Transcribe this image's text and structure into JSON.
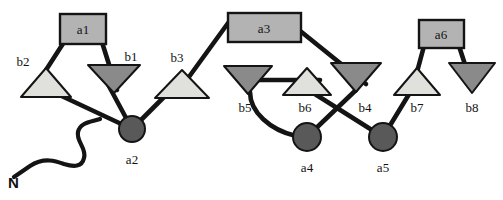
{
  "figure": {
    "type": "diagram",
    "background_color": "#ffffff",
    "stroke_color": "#141414"
  },
  "palette": {
    "box_fill": "#b3b3b3",
    "box_stroke": "#141414",
    "circle_fill": "#595959",
    "circle_stroke": "#141414",
    "triangle_light_fill": "#e0e0dc",
    "triangle_dark_fill": "#8a8a8a",
    "triangle_stroke": "#141414",
    "line_color": "#141414",
    "text_color": "#111111"
  },
  "nodes": {
    "boxes": [
      {
        "id": "a1",
        "label": "a1",
        "x": 60,
        "y": 14,
        "w": 46,
        "h": 30,
        "label_x": 83,
        "label_y": 34
      },
      {
        "id": "a3",
        "label": "a3",
        "x": 228,
        "y": 13,
        "w": 73,
        "h": 29,
        "label_x": 264,
        "label_y": 33
      },
      {
        "id": "a6",
        "label": "a6",
        "x": 419,
        "y": 20,
        "w": 45,
        "h": 28,
        "label_x": 441,
        "label_y": 39
      }
    ],
    "circles": [
      {
        "id": "a2",
        "label": "a2",
        "cx": 132,
        "cy": 129,
        "r": 13,
        "label_x": 132,
        "label_y": 164
      },
      {
        "id": "a4",
        "label": "a4",
        "cx": 307,
        "cy": 137,
        "r": 14,
        "label_x": 307,
        "label_y": 172
      },
      {
        "id": "a5",
        "label": "a5",
        "cx": 383,
        "cy": 137,
        "r": 14,
        "label_x": 383,
        "label_y": 172
      }
    ],
    "triangles": [
      {
        "id": "b2",
        "label": "b2",
        "dir": "up",
        "shade": "light",
        "cx": 46,
        "top_y": 68,
        "base_y": 97,
        "half_w": 25,
        "label_x": 23,
        "label_y": 66
      },
      {
        "id": "b1",
        "label": "b1",
        "dir": "down",
        "shade": "dark",
        "cx": 114,
        "top_y": 65,
        "base_y": 93,
        "half_w": 26,
        "label_x": 131,
        "label_y": 61
      },
      {
        "id": "b3",
        "label": "b3",
        "dir": "up",
        "shade": "light",
        "cx": 182,
        "top_y": 70,
        "base_y": 98,
        "half_w": 27,
        "label_x": 177,
        "label_y": 62
      },
      {
        "id": "b5",
        "label": "b5",
        "dir": "down",
        "shade": "dark",
        "cx": 248,
        "top_y": 66,
        "base_y": 94,
        "half_w": 24,
        "label_x": 245,
        "label_y": 112
      },
      {
        "id": "b6",
        "label": "b6",
        "dir": "up",
        "shade": "light",
        "cx": 307,
        "top_y": 68,
        "base_y": 95,
        "half_w": 24,
        "label_x": 305,
        "label_y": 112
      },
      {
        "id": "b4",
        "label": "b4",
        "dir": "down",
        "shade": "dark",
        "cx": 356,
        "top_y": 63,
        "base_y": 92,
        "half_w": 25,
        "label_x": 365,
        "label_y": 112
      },
      {
        "id": "b7",
        "label": "b7",
        "dir": "up",
        "shade": "light",
        "cx": 417,
        "top_y": 68,
        "base_y": 95,
        "half_w": 23,
        "label_x": 417,
        "label_y": 112
      },
      {
        "id": "b8",
        "label": "b8",
        "dir": "down",
        "shade": "dark",
        "cx": 472,
        "top_y": 63,
        "base_y": 93,
        "half_w": 23,
        "label_x": 472,
        "label_y": 112
      }
    ]
  },
  "terminus": {
    "label": "N",
    "label_x": 8,
    "label_y": 188,
    "path": "M 14 177 L 30 166 C 44 157 56 161 64 164 C 74 167 82 167 84 158 C 87 148 76 142 78 132 C 80 122 92 122 100 119"
  },
  "connectors": [
    {
      "from": "b2-apex",
      "to": "a1-left",
      "d": "M 46 70 L 66 39"
    },
    {
      "from": "a1-right",
      "to": "b1-apex",
      "d": "M 101 39 L 117 90"
    },
    {
      "from": "b2-body",
      "to": "a2",
      "d": "M 36 84 L 132 129"
    },
    {
      "from": "a2",
      "to": "b1-body",
      "d": "M 132 129 L 104 77"
    },
    {
      "from": "a2",
      "to": "b3-body",
      "d": "M 132 129 L 176 85"
    },
    {
      "from": "b3-apex",
      "to": "a3-left",
      "d": "M 178 92 L 231 19"
    },
    {
      "from": "a3-right",
      "to": "b4-body",
      "d": "M 299 30 L 366 84"
    },
    {
      "from": "b5-body",
      "to": "b6-body",
      "d": "M 253 80 L 320 80"
    },
    {
      "from": "b5-tip",
      "to": "a4",
      "d": "M 250 92 C 250 112 270 130 296 136"
    },
    {
      "from": "b6-body",
      "to": "a5",
      "d": "M 299 84 L 383 137"
    },
    {
      "from": "b4-tip",
      "to": "a4",
      "d": "M 356 90 L 310 134"
    },
    {
      "from": "a5",
      "to": "b7-body",
      "d": "M 383 137 L 414 86"
    },
    {
      "from": "b7-apex",
      "to": "a6-left",
      "d": "M 417 72 L 424 46"
    },
    {
      "from": "a6-right",
      "to": "b8-apex",
      "d": "M 459 46 L 472 86"
    }
  ]
}
